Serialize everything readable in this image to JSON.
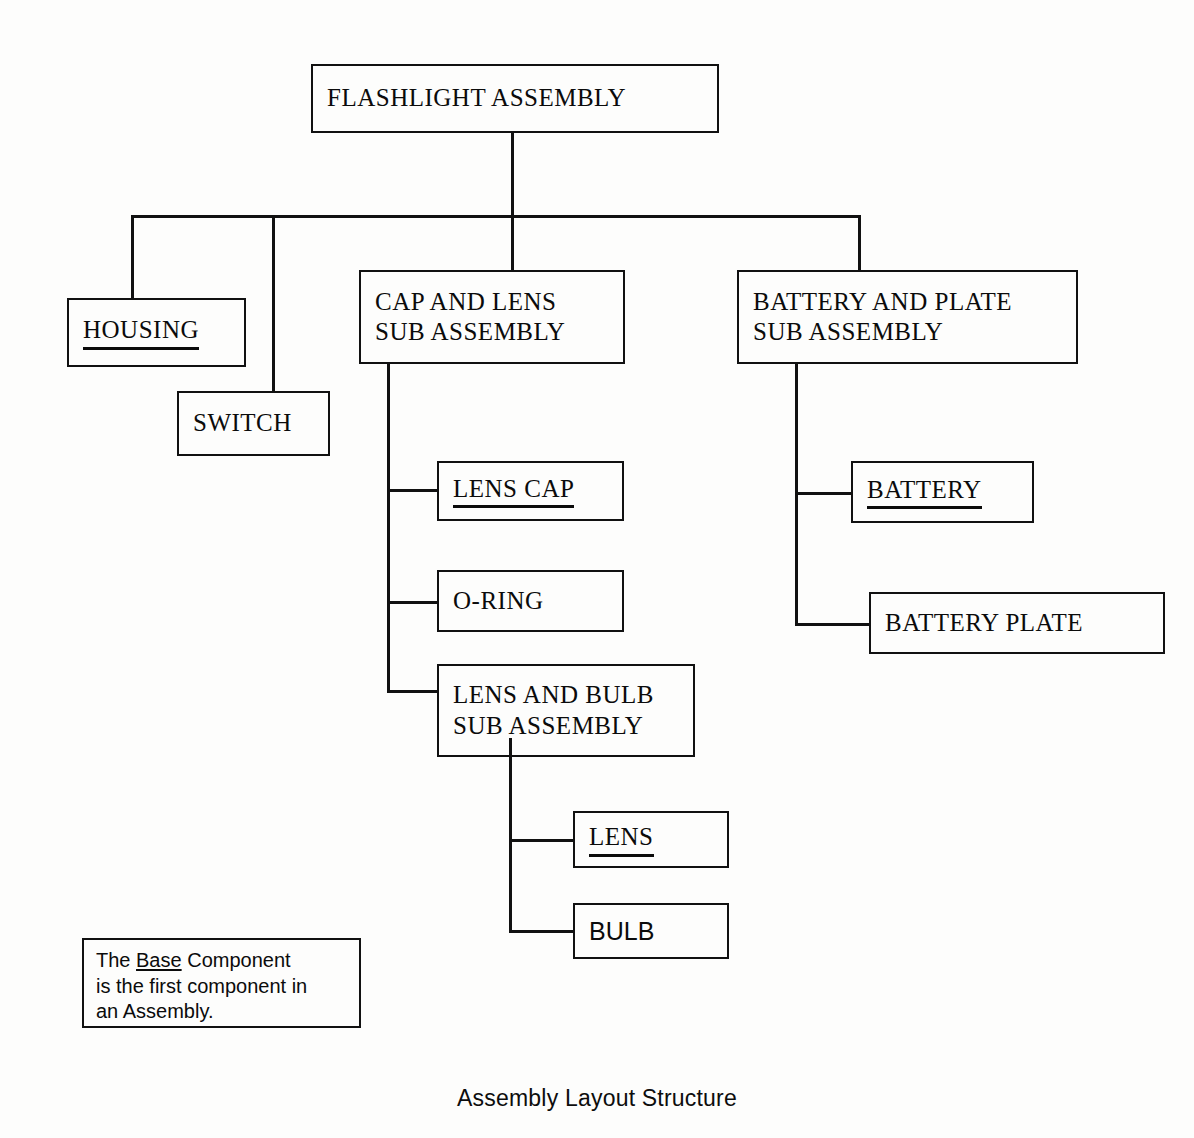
{
  "diagram": {
    "caption": "Assembly Layout Structure",
    "legend": {
      "prefix": "The ",
      "emphasis": "Base",
      "suffix": " Component is the first component in an Assembly.",
      "line1_prefix": "The ",
      "line1_emphasis": "Base",
      "line1_suffix": " Component",
      "line2": "is the first component in",
      "line3": "an Assembly."
    },
    "colors": {
      "stroke": "#111111",
      "text": "#0b0b0b",
      "background": "#fdfdfc"
    }
  },
  "nodes": {
    "root": {
      "label": "FLASHLIGHT ASSEMBLY",
      "is_base": false,
      "font": "serif",
      "lines": [
        "FLASHLIGHT ASSEMBLY"
      ]
    },
    "housing": {
      "label": "HOUSING",
      "is_base": true,
      "font": "serif",
      "lines": [
        "HOUSING"
      ]
    },
    "switch": {
      "label": "SWITCH",
      "is_base": false,
      "font": "serif",
      "lines": [
        "SWITCH"
      ]
    },
    "cap_and_lens": {
      "label": "CAP AND LENS SUB ASSEMBLY",
      "is_base": false,
      "font": "serif",
      "lines": [
        "CAP AND LENS",
        "SUB ASSEMBLY"
      ]
    },
    "battery_and_plate": {
      "label": "BATTERY AND PLATE SUB ASSEMBLY",
      "is_base": false,
      "font": "serif",
      "lines": [
        "BATTERY AND PLATE",
        "SUB ASSEMBLY"
      ]
    },
    "lens_cap": {
      "label": "LENS CAP",
      "is_base": true,
      "font": "serif",
      "lines": [
        "LENS CAP"
      ]
    },
    "o_ring": {
      "label": "O-RING",
      "is_base": false,
      "font": "serif",
      "lines": [
        "O-RING"
      ]
    },
    "lens_and_bulb": {
      "label": "LENS AND BULB SUB ASSEMBLY",
      "is_base": false,
      "font": "serif",
      "lines": [
        "LENS AND BULB",
        "SUB ASSEMBLY"
      ]
    },
    "battery": {
      "label": "BATTERY",
      "is_base": true,
      "font": "serif",
      "lines": [
        "BATTERY"
      ]
    },
    "battery_plate": {
      "label": "BATTERY PLATE",
      "is_base": false,
      "font": "serif",
      "lines": [
        "BATTERY PLATE"
      ]
    },
    "lens": {
      "label": "LENS",
      "is_base": true,
      "font": "serif",
      "lines": [
        "LENS"
      ]
    },
    "bulb": {
      "label": "BULB",
      "is_base": false,
      "font": "sans",
      "lines": [
        "BULB"
      ]
    }
  },
  "hierarchy": {
    "root": "FLASHLIGHT ASSEMBLY",
    "children": [
      {
        "name": "HOUSING",
        "base": true,
        "children": []
      },
      {
        "name": "SWITCH",
        "base": false,
        "children": []
      },
      {
        "name": "CAP AND LENS SUB ASSEMBLY",
        "base": false,
        "children": [
          {
            "name": "LENS CAP",
            "base": true,
            "children": []
          },
          {
            "name": "O-RING",
            "base": false,
            "children": []
          },
          {
            "name": "LENS AND BULB SUB ASSEMBLY",
            "base": false,
            "children": [
              {
                "name": "LENS",
                "base": true,
                "children": []
              },
              {
                "name": "BULB",
                "base": false,
                "children": []
              }
            ]
          }
        ]
      },
      {
        "name": "BATTERY AND PLATE SUB ASSEMBLY",
        "base": false,
        "children": [
          {
            "name": "BATTERY",
            "base": true,
            "children": []
          },
          {
            "name": "BATTERY PLATE",
            "base": false,
            "children": []
          }
        ]
      }
    ]
  }
}
